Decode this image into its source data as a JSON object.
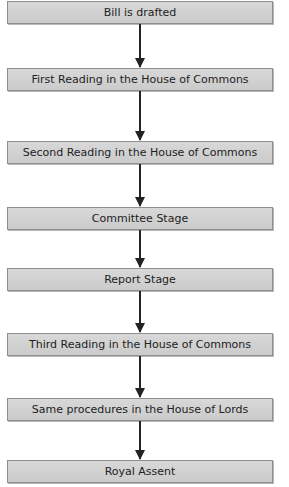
{
  "flowchart": {
    "steps": [
      {
        "label": "Bill is drafted"
      },
      {
        "label": "First Reading in the House of Commons"
      },
      {
        "label": "Second Reading in the House of Commons"
      },
      {
        "label": "Committee Stage"
      },
      {
        "label": "Report Stage"
      },
      {
        "label": "Third Reading in the House of Commons"
      },
      {
        "label": "Same procedures in the House of Lords"
      },
      {
        "label": "Royal Assent"
      }
    ],
    "colors": {
      "box_fill": "#d0d0d0",
      "box_border": "#8e8e8e",
      "arrow": "#222222"
    }
  }
}
